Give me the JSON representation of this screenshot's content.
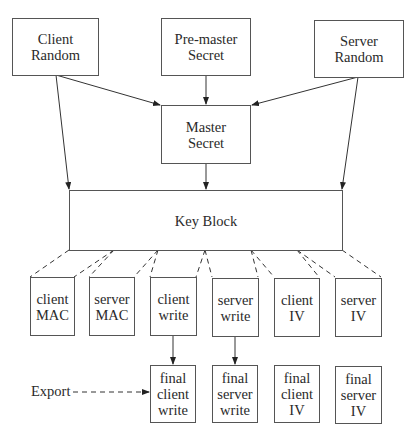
{
  "diagram": {
    "type": "key-derivation-flow",
    "top_inputs": [
      {
        "id": "client-random",
        "lines": [
          "Client",
          "Random"
        ]
      },
      {
        "id": "pre-master-secret",
        "lines": [
          "Pre-master",
          "Secret"
        ]
      },
      {
        "id": "server-random",
        "lines": [
          "Server",
          "Random"
        ]
      }
    ],
    "master_secret": {
      "lines": [
        "Master",
        "Secret"
      ]
    },
    "key_block": {
      "label": "Key Block"
    },
    "key_parts": [
      {
        "id": "client-mac",
        "lines": [
          "client",
          "MAC"
        ]
      },
      {
        "id": "server-mac",
        "lines": [
          "server",
          "MAC"
        ]
      },
      {
        "id": "client-write",
        "lines": [
          "client",
          "write"
        ]
      },
      {
        "id": "server-write",
        "lines": [
          "server",
          "write"
        ]
      },
      {
        "id": "client-iv",
        "lines": [
          "client",
          "IV"
        ]
      },
      {
        "id": "server-iv",
        "lines": [
          "server",
          "IV"
        ]
      }
    ],
    "final_keys": [
      {
        "id": "final-client-write",
        "lines": [
          "final",
          "client",
          "write"
        ]
      },
      {
        "id": "final-server-write",
        "lines": [
          "final",
          "server",
          "write"
        ]
      },
      {
        "id": "final-client-iv",
        "lines": [
          "final",
          "client",
          "IV"
        ]
      },
      {
        "id": "final-server-iv",
        "lines": [
          "final",
          "server",
          "IV"
        ]
      }
    ],
    "export_label": "Export",
    "colors": {
      "line": "#333333",
      "box_border": "#555555",
      "text": "#2a2a2a"
    }
  }
}
